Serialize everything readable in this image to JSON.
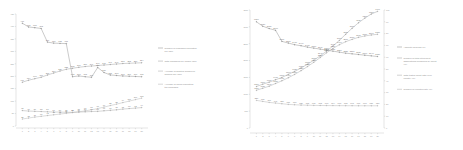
{
  "figure": {
    "background": "#ffffff",
    "panels": 2
  },
  "chart_data": [
    {
      "id": "left-chart",
      "type": "line",
      "title": "",
      "subtitle": "",
      "xlabel": "",
      "ylabel": "",
      "grid": false,
      "legend_position": "right",
      "axis": {
        "x_range": [
          0,
          21
        ],
        "y_left_range": [
          0,
          450
        ],
        "y_left_ticks": [
          "450",
          "400",
          "350",
          "300",
          "250",
          "200",
          "150",
          "100",
          "50",
          "0"
        ],
        "x_ticks": [
          "1",
          "2",
          "3",
          "4",
          "5",
          "6",
          "7",
          "8",
          "9",
          "10",
          "11",
          "12",
          "13",
          "14",
          "15",
          "16",
          "17",
          "18",
          "19",
          "20"
        ]
      },
      "x": [
        1,
        2,
        3,
        4,
        5,
        6,
        7,
        8,
        9,
        10,
        11,
        12,
        13,
        14,
        15,
        16,
        17,
        18,
        19,
        20
      ],
      "series": [
        {
          "name": "Number of packages requested per user",
          "color": "#8a8a8a",
          "values": [
            413,
            398,
            395,
            392,
            337,
            333,
            332,
            331,
            198,
            201,
            198,
            196,
            235,
            215,
            205,
            203,
            201,
            200,
            199,
            198
          ],
          "labels": [
            "413",
            "398",
            "395",
            "392",
            "337",
            "333",
            "332",
            "331",
            "198",
            "201",
            "198",
            "196",
            "235",
            "215",
            "205",
            "203",
            "201",
            "200",
            "199",
            "198"
          ]
        },
        {
          "name": "Total packages per unique user",
          "color": "#9b9b9b",
          "values": [
            176,
            184,
            190,
            196,
            205,
            213,
            221,
            228,
            232,
            236,
            239,
            241,
            243,
            245,
            247,
            249,
            251,
            252,
            253,
            254
          ],
          "labels": [
            "176",
            "184",
            "190",
            "196",
            "205",
            "213",
            "221",
            "228",
            "232",
            "236",
            "239",
            "241",
            "243",
            "245",
            "247",
            "249",
            "251",
            "252",
            "253",
            "254"
          ]
        },
        {
          "name": "Average of granted allowed or allowed any user",
          "color": "#a4a4a4",
          "values": [
            62,
            60,
            59,
            58,
            57,
            56,
            56,
            55,
            55,
            56,
            57,
            58,
            59,
            61,
            63,
            65,
            68,
            70,
            72,
            74
          ],
          "labels": [
            "62",
            "60",
            "59",
            "58",
            "57",
            "56",
            "56",
            "55",
            "55",
            "56",
            "57",
            "58",
            "59",
            "61",
            "63",
            "65",
            "68",
            "70",
            "72",
            "74"
          ]
        },
        {
          "name": "Average of users requesting the packages",
          "color": "#b0b0b0",
          "values": [
            28,
            32,
            36,
            39,
            42,
            45,
            48,
            51,
            54,
            57,
            61,
            65,
            70,
            76,
            82,
            88,
            94,
            100,
            106,
            112
          ],
          "labels": [
            "28",
            "32",
            "36",
            "39",
            "42",
            "45",
            "48",
            "51",
            "54",
            "57",
            "61",
            "65",
            "70",
            "76",
            "82",
            "88",
            "94",
            "100",
            "106",
            "112"
          ]
        }
      ]
    },
    {
      "id": "right-chart",
      "type": "line",
      "title": "",
      "subtitle": "",
      "xlabel": "",
      "ylabel": "",
      "grid": false,
      "legend_position": "right",
      "axis": {
        "x_range": [
          0,
          21
        ],
        "y_left_range": [
          0,
          3500
        ],
        "y_left_ticks": [
          "3500",
          "3000",
          "2500",
          "2000",
          "1500",
          "1000",
          "500",
          "0"
        ],
        "y_right_range": [
          0,
          100
        ],
        "y_right_ticks": [
          "100",
          "90",
          "80",
          "70",
          "60",
          "50",
          "40",
          "30",
          "20",
          "10",
          "0"
        ],
        "x_ticks": [
          "1",
          "2",
          "3",
          "4",
          "5",
          "6",
          "7",
          "8",
          "9",
          "10",
          "11",
          "12",
          "13",
          "14",
          "15",
          "16",
          "17",
          "18",
          "19",
          "20"
        ]
      },
      "x": [
        1,
        2,
        3,
        4,
        5,
        6,
        7,
        8,
        9,
        10,
        11,
        12,
        13,
        14,
        15,
        16,
        17,
        18,
        19,
        20
      ],
      "series": [
        {
          "name": "Absolute analysis (%)",
          "color": "#8a8a8a",
          "values": [
            3150,
            3020,
            2950,
            2900,
            2570,
            2520,
            2470,
            2440,
            2400,
            2370,
            2340,
            2310,
            2280,
            2250,
            2220,
            2200,
            2180,
            2160,
            2140,
            2120
          ],
          "labels": [
            "3150",
            "3020",
            "2950",
            "2900",
            "2570",
            "2520",
            "2470",
            "2440",
            "2400",
            "2370",
            "2340",
            "2310",
            "2280",
            "2250",
            "2220",
            "2200",
            "2180",
            "2160",
            "2140",
            "2120"
          ]
        },
        {
          "name": "Number of total cited input associations measured by count (%)",
          "color": "#9b9b9b",
          "values": [
            1230,
            1300,
            1360,
            1430,
            1500,
            1590,
            1680,
            1780,
            1890,
            2010,
            2140,
            2280,
            2430,
            2600,
            2780,
            2960,
            3120,
            3260,
            3380,
            3460
          ],
          "labels": [
            "1230",
            "1300",
            "1360",
            "1430",
            "1500",
            "1590",
            "1680",
            "1780",
            "1890",
            "2010",
            "2140",
            "2280",
            "2430",
            "2600",
            "2780",
            "2960",
            "3120",
            "3260",
            "3380",
            "3460"
          ]
        },
        {
          "name": "Total tested count ratio over country (%)",
          "color": "#a4a4a4",
          "values": [
            1120,
            1180,
            1240,
            1320,
            1400,
            1490,
            1590,
            1700,
            1820,
            1950,
            2090,
            2230,
            2360,
            2470,
            2560,
            2630,
            2690,
            2730,
            2760,
            2780
          ],
          "labels": [
            "1120",
            "1180",
            "1240",
            "1320",
            "1400",
            "1490",
            "1590",
            "1700",
            "1820",
            "1950",
            "2090",
            "2230",
            "2360",
            "2470",
            "2560",
            "2630",
            "2690",
            "2730",
            "2760",
            "2780"
          ]
        },
        {
          "name": "Number of reported rate (%)",
          "color": "#b0b0b0",
          "values": [
            820,
            790,
            760,
            740,
            720,
            700,
            690,
            680,
            675,
            670,
            668,
            666,
            664,
            663,
            662,
            661,
            660,
            660,
            659,
            659
          ],
          "labels": [
            "820",
            "790",
            "760",
            "740",
            "720",
            "700",
            "690",
            "680",
            "675",
            "670",
            "668",
            "666",
            "664",
            "663",
            "662",
            "661",
            "660",
            "660",
            "659",
            "659"
          ]
        }
      ]
    }
  ]
}
